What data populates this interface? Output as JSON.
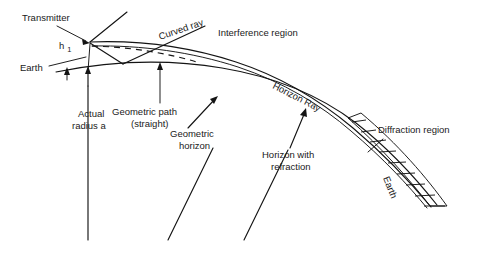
{
  "figure": {
    "background_color": "#ffffff",
    "ink_color": "#141414"
  },
  "labels": {
    "transmitter": "Transmitter",
    "height_symbol": "h",
    "height_subscript": "1",
    "earth_left": "Earth",
    "curved_ray": "Curved ray",
    "interference_region": "Interference region",
    "geometric_path_line1": "Geometric path",
    "geometric_path_line2": "(straight)",
    "actual_radius_line1": "Actual",
    "actual_radius_line2": "radius a",
    "geometric_horizon_line1": "Geometric",
    "geometric_horizon_line2": "horizon",
    "horizon_ray": "Horizon Ray",
    "horizon_with_refraction_line1": "Horizon with",
    "horizon_with_refraction_line2": "refraction",
    "diffraction_region": "Diffraction region",
    "earth_band": "Earth"
  }
}
